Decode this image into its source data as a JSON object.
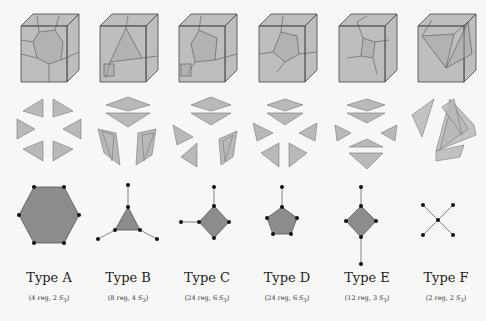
{
  "colors": {
    "background": "#f7f7f5",
    "face_fill": "#8f8f8f",
    "edge": "#444444",
    "triangle_fill": "#b9b9b9",
    "triangle_edge": "#777777",
    "polygon_fill": "#8c8c8c",
    "vertex": "#111111",
    "graph_edge": "#666666"
  },
  "types": [
    {
      "id": "A",
      "title": "Type A",
      "reg": "4 reg,",
      "s3_count": "2",
      "group_symbol": "S",
      "group_subscript": "3",
      "graph": "hexagon",
      "center_x": 49
    },
    {
      "id": "B",
      "title": "Type B",
      "reg": "8 reg,",
      "s3_count": "4",
      "group_symbol": "S",
      "group_subscript": "3",
      "graph": "triangle-with-3-legs",
      "center_x": 128
    },
    {
      "id": "C",
      "title": "Type C",
      "reg": "24 reg,",
      "s3_count": "6",
      "group_symbol": "S",
      "group_subscript": "3",
      "graph": "square-with-2-legs",
      "center_x": 207
    },
    {
      "id": "D",
      "title": "Type D",
      "reg": "24 reg,",
      "s3_count": "6",
      "group_symbol": "S",
      "group_subscript": "3",
      "graph": "pentagon-with-1-leg",
      "center_x": 287
    },
    {
      "id": "E",
      "title": "Type E",
      "reg": "12 reg,",
      "s3_count": "3",
      "group_symbol": "S",
      "group_subscript": "3",
      "graph": "square-with-2-opposite-legs",
      "center_x": 367
    },
    {
      "id": "F",
      "title": "Type F",
      "reg": "2 reg,",
      "s3_count": "2",
      "group_symbol": "S",
      "group_subscript": "3",
      "graph": "x-cross",
      "center_x": 446
    }
  ]
}
